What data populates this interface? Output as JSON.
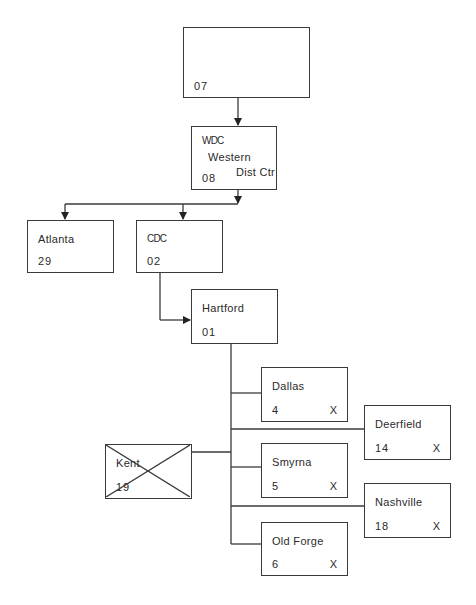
{
  "diagram": {
    "type": "org-chart",
    "line_color": "#3a3a3a",
    "nodes": {
      "root": {
        "name": "",
        "code": "07"
      },
      "wdc": {
        "name": "WDC",
        "line2": "Western",
        "line3": "Dist  Ctr",
        "code": "08"
      },
      "atlanta": {
        "name": "Atlanta",
        "code": "29"
      },
      "cdc": {
        "name": "CDC",
        "code": "02"
      },
      "hartford": {
        "name": "Hartford",
        "code": "01"
      },
      "dallas": {
        "name": "Dallas",
        "code": "4",
        "mark": "X"
      },
      "deerfield": {
        "name": "Deerfield",
        "code": "14",
        "mark": "X"
      },
      "smyrna": {
        "name": "Smyrna",
        "code": "5",
        "mark": "X"
      },
      "kent": {
        "name": "Kent",
        "code": "19",
        "crossed_out": true
      },
      "nashville": {
        "name": "Nashville",
        "code": "18",
        "mark": "X"
      },
      "old_forge": {
        "name": "Old Forge",
        "code": "6",
        "mark": "X"
      }
    },
    "edges": [
      [
        "07",
        "08"
      ],
      [
        "08",
        "29"
      ],
      [
        "08",
        "02"
      ],
      [
        "02",
        "01"
      ],
      [
        "01",
        "4"
      ],
      [
        "01",
        "14"
      ],
      [
        "01",
        "5"
      ],
      [
        "01",
        "19"
      ],
      [
        "01",
        "18"
      ],
      [
        "01",
        "6"
      ]
    ]
  }
}
